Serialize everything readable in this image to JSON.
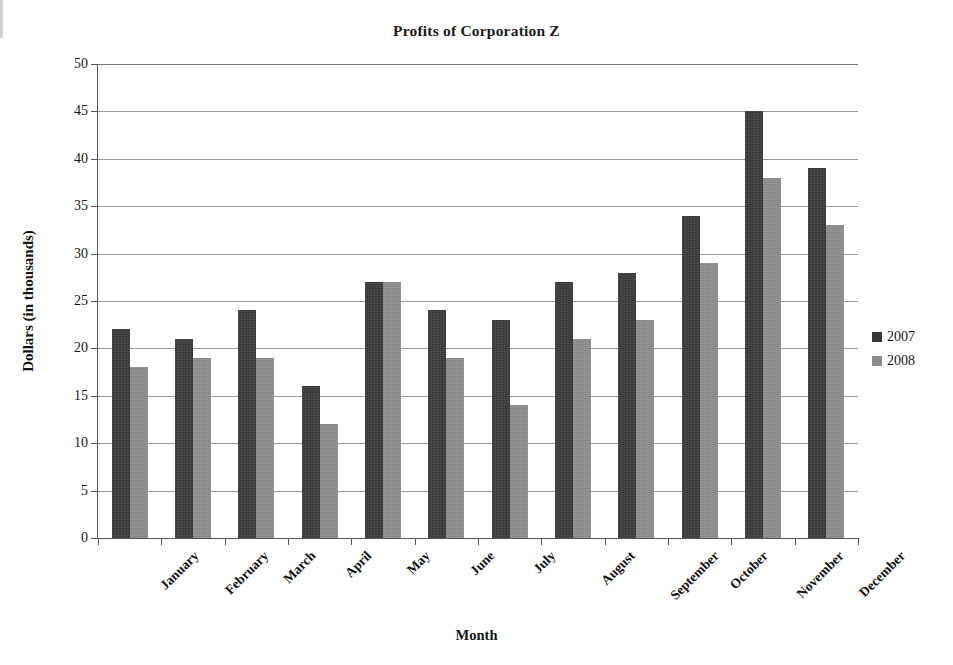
{
  "chart_data": {
    "type": "bar",
    "title": "Profits of Corporation Z",
    "xlabel": "Month",
    "ylabel": "Dollars (in thousands)",
    "categories": [
      "January",
      "February",
      "March",
      "April",
      "May",
      "June",
      "July",
      "August",
      "September",
      "October",
      "November",
      "December"
    ],
    "series": [
      {
        "name": "2007",
        "color": "#393939",
        "values": [
          22,
          21,
          24,
          16,
          27,
          24,
          23,
          27,
          28,
          34,
          45,
          39
        ]
      },
      {
        "name": "2008",
        "color": "#8b8b8b",
        "values": [
          18,
          19,
          19,
          12,
          27,
          19,
          14,
          21,
          23,
          29,
          38,
          33
        ]
      }
    ],
    "ylim": [
      0,
      50
    ],
    "ytick_labels": [
      "50",
      "45",
      "40",
      "35",
      "30",
      "25",
      "20",
      "15",
      "10",
      "5",
      "0"
    ],
    "ytick_values": [
      50,
      45,
      40,
      35,
      30,
      25,
      20,
      15,
      10,
      5,
      0
    ],
    "ystep": 5,
    "grid": true,
    "legend_position": "right"
  },
  "legend": {
    "entries": [
      {
        "label": "2007",
        "color": "#393939"
      },
      {
        "label": "2008",
        "color": "#8b8b8b"
      }
    ]
  }
}
